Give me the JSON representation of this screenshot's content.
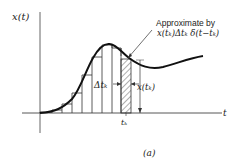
{
  "figure": {
    "y_axis_label": "x(t)",
    "x_axis_label": "t",
    "annotation_line1": "Approximate by",
    "annotation_line2": "x(tₖ)Δtₖ δ(t−tₖ)",
    "delta_label": "Δtₖ",
    "height_label": "x(tₖ)",
    "tick_label": "tₖ",
    "caption": "(a)",
    "colors": {
      "ink": "#1a1a1a",
      "axis": "#555555",
      "background": "#ffffff"
    }
  }
}
